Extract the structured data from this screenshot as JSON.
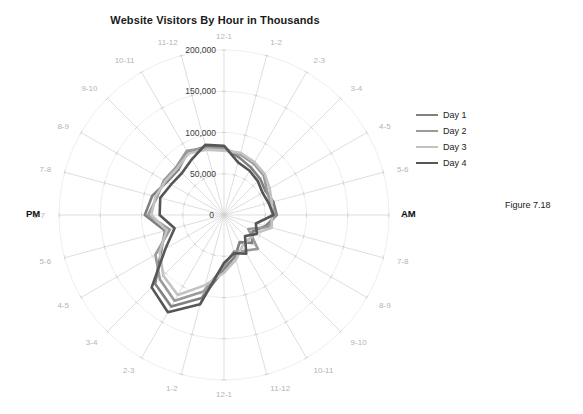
{
  "figure": {
    "caption": "Figure 7.18"
  },
  "chart_data": {
    "type": "line",
    "subtype": "radar",
    "title": "Website Visitors By Hour in Thousands",
    "xlabel": "",
    "ylabel": "",
    "grid": true,
    "legend_position": "right",
    "rlim": [
      0,
      200000
    ],
    "rticks": [
      0,
      50000,
      100000,
      150000,
      200000
    ],
    "rtick_labels": [
      "0",
      "50,000",
      "100,000",
      "150,000",
      "200,000"
    ],
    "period_labels": {
      "am": "AM",
      "pm": "PM"
    },
    "categories": [
      "12-1",
      "1-2",
      "2-3",
      "3-4",
      "4-5",
      "5-6",
      "6-7",
      "7-8",
      "8-9",
      "9-10",
      "10-11",
      "11-12",
      "12-1",
      "1-2",
      "2-3",
      "3-4",
      "4-5",
      "5-6",
      "6-7",
      "7-8",
      "8-9",
      "9-10",
      "10-11",
      "11-12"
    ],
    "series": [
      {
        "name": "Day 1",
        "color": "#808080",
        "values": [
          82000,
          72000,
          66000,
          62000,
          58000,
          62000,
          64000,
          52000,
          40000,
          48000,
          38000,
          52000,
          66000,
          104000,
          128000,
          118000,
          88000,
          74000,
          96000,
          90000,
          80000,
          78000,
          88000,
          86000
        ]
      },
      {
        "name": "Day 2",
        "color": "#9a9a9a",
        "values": [
          80000,
          76000,
          72000,
          68000,
          60000,
          58000,
          62000,
          56000,
          34000,
          58000,
          50000,
          46000,
          62000,
          96000,
          120000,
          110000,
          96000,
          68000,
          92000,
          84000,
          84000,
          82000,
          90000,
          84000
        ]
      },
      {
        "name": "Day 3",
        "color": "#c2c2c2",
        "values": [
          78000,
          78000,
          74000,
          70000,
          64000,
          60000,
          58000,
          60000,
          44000,
          42000,
          44000,
          56000,
          70000,
          88000,
          112000,
          104000,
          90000,
          72000,
          88000,
          86000,
          82000,
          80000,
          86000,
          82000
        ]
      },
      {
        "name": "Day 4",
        "color": "#565656",
        "values": [
          84000,
          66000,
          62000,
          58000,
          54000,
          56000,
          60000,
          40000,
          46000,
          36000,
          54000,
          48000,
          58000,
          112000,
          136000,
          124000,
          82000,
          62000,
          78000,
          80000,
          74000,
          72000,
          78000,
          88000
        ]
      }
    ]
  },
  "legend": {
    "items": [
      {
        "label": "Day 1"
      },
      {
        "label": "Day 2"
      },
      {
        "label": "Day 3"
      },
      {
        "label": "Day 4"
      }
    ]
  }
}
